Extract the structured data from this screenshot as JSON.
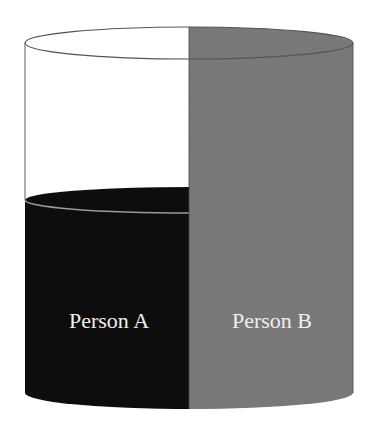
{
  "diagram": {
    "type": "cylinder-split",
    "colors": {
      "background": "#ffffff",
      "outline": "#666666",
      "person_a_fill": "#111111",
      "person_b_fill": "#7b7b7b",
      "empty_fill": "#ffffff",
      "label_color": "#efefef",
      "rim_highlight": "#9a9a9a"
    },
    "sections": [
      {
        "label": "Person A",
        "side": "left",
        "fill_level": "partial",
        "fill_fraction": 0.58
      },
      {
        "label": "Person B",
        "side": "right",
        "fill_level": "full",
        "fill_fraction": 1.0
      }
    ]
  }
}
